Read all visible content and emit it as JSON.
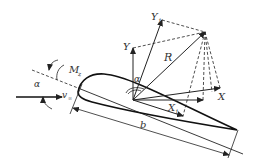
{
  "diagram": {
    "labels": {
      "alpha_left": "α",
      "alpha_top": "α",
      "moment": "M",
      "moment_sub": "z",
      "velocity": "v",
      "velocity_sub": "∞",
      "Y": "Y",
      "Y1": "Y",
      "Y1_sub": "1",
      "R": "R",
      "X": "X",
      "X1": "X",
      "X1_sub": "1",
      "chord": "b"
    },
    "colors": {
      "line": "#222222",
      "label": "#333333",
      "background": "#ffffff"
    }
  }
}
